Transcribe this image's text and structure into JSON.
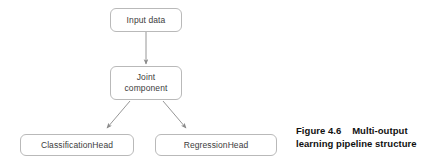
{
  "figure": {
    "colors": {
      "background": "#ffffff",
      "node_border": "#b9b9b9",
      "node_fill": "#ffffff",
      "node_text": "#3c3c3c",
      "edge": "#8a8a8a",
      "caption_text": "#111111"
    },
    "nodes": [
      {
        "id": "input-data",
        "label": "Input data"
      },
      {
        "id": "joint-component",
        "label": "Joint\ncomponent"
      },
      {
        "id": "classification-head",
        "label": "ClassificationHead"
      },
      {
        "id": "regression-head",
        "label": "RegressionHead"
      }
    ],
    "edges": [
      {
        "id": "input-to-joint",
        "from": "input-data",
        "to": "joint-component",
        "style": "straight-arrow",
        "direction": "down"
      },
      {
        "id": "joint-to-classification",
        "from": "joint-component",
        "to": "classification-head",
        "style": "straight-arrow",
        "direction": "down-left"
      },
      {
        "id": "joint-to-regression",
        "from": "joint-component",
        "to": "regression-head",
        "style": "straight-arrow",
        "direction": "down-right"
      }
    ],
    "caption": {
      "line1": "Figure 4.6    Multi-output",
      "line2": "learning pipeline structure"
    }
  }
}
